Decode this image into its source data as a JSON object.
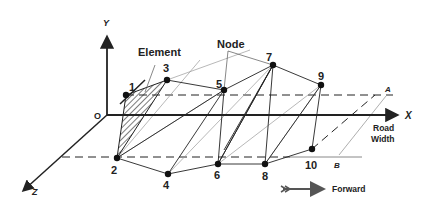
{
  "diagram": {
    "title_labels": {
      "element": "Element",
      "node": "Node",
      "road_width_line1": "Road",
      "road_width_line2": "Width",
      "forward": "Forward"
    },
    "axes": {
      "x": "X",
      "y": "Y",
      "z": "Z",
      "origin": "O"
    },
    "points": {
      "a": "A",
      "b": "B"
    },
    "nodes": [
      {
        "id": "1",
        "x": 126,
        "y": 95
      },
      {
        "id": "2",
        "x": 117,
        "y": 158
      },
      {
        "id": "3",
        "x": 167,
        "y": 80
      },
      {
        "id": "4",
        "x": 168,
        "y": 174
      },
      {
        "id": "5",
        "x": 224,
        "y": 90
      },
      {
        "id": "6",
        "x": 218,
        "y": 164
      },
      {
        "id": "7",
        "x": 273,
        "y": 65
      },
      {
        "id": "8",
        "x": 265,
        "y": 164
      },
      {
        "id": "9",
        "x": 321,
        "y": 85
      },
      {
        "id": "10",
        "x": 312,
        "y": 149
      }
    ],
    "colors": {
      "line": "#222222",
      "light_line": "#9a9a9a",
      "background": "#ffffff"
    }
  }
}
